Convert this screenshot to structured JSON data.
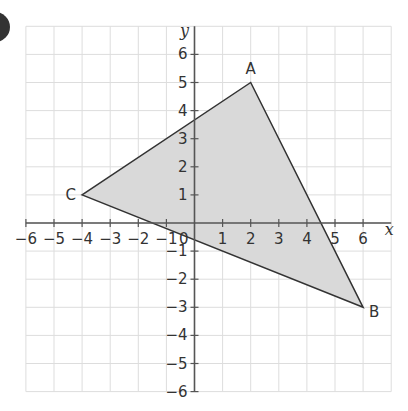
{
  "diagram": {
    "type": "coordinate-grid-triangle",
    "question_marker_color": "#333333",
    "axes": {
      "x_label": "x",
      "y_label": "y",
      "x_range": [
        -6,
        7
      ],
      "y_range": [
        -6,
        7
      ],
      "x_ticks": [
        "-6",
        "-5",
        "-4",
        "-3",
        "-2",
        "-1",
        "1",
        "2",
        "3",
        "4",
        "5",
        "6"
      ],
      "y_ticks": [
        "6",
        "5",
        "4",
        "3",
        "2",
        "1",
        "-1",
        "-2",
        "-3",
        "-4",
        "-5",
        "-6"
      ],
      "origin_label": "0"
    },
    "triangle": {
      "fill": "#d9d9d9",
      "stroke": "#333333",
      "vertices": [
        {
          "label": "A",
          "x": 2,
          "y": 5
        },
        {
          "label": "B",
          "x": 6,
          "y": -3
        },
        {
          "label": "C",
          "x": -4,
          "y": 1
        }
      ]
    },
    "grid_color": "#dddddd",
    "axis_color": "#555555"
  }
}
